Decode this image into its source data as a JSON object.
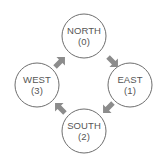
{
  "diagram": {
    "nodes": [
      {
        "id": "north",
        "name": "NORTH",
        "index": "(0)",
        "cx": 84,
        "cy": 36
      },
      {
        "id": "east",
        "name": "EAST",
        "index": "(1)",
        "cx": 130,
        "cy": 85
      },
      {
        "id": "south",
        "name": "SOUTH",
        "index": "(2)",
        "cx": 84,
        "cy": 131
      },
      {
        "id": "west",
        "name": "WEST",
        "index": "(3)",
        "cx": 37,
        "cy": 85
      }
    ],
    "edges": [
      {
        "from": "NORTH",
        "to": "EAST",
        "direction": "down-right"
      },
      {
        "from": "EAST",
        "to": "SOUTH",
        "direction": "down-left"
      },
      {
        "from": "SOUTH",
        "to": "WEST",
        "direction": "up-left"
      },
      {
        "from": "WEST",
        "to": "NORTH",
        "direction": "up-right"
      }
    ],
    "colors": {
      "circle_stroke": "#6e6e6e",
      "arrow_fill": "#8c8c8c",
      "text": "#555555",
      "background": "#ffffff"
    }
  }
}
